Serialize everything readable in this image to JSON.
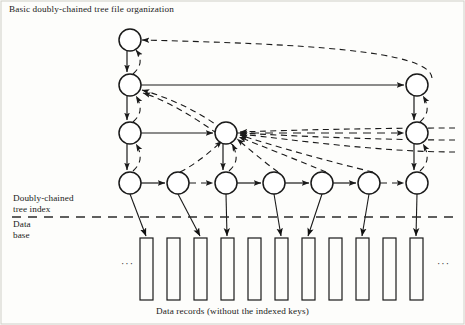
{
  "figure": {
    "title": "Basic doubly-chained tree file organization",
    "caption": "Data records (without the indexed keys)",
    "region_labels": {
      "index": "Doubly-chained\ntree index",
      "database": "Data\nbase"
    },
    "ellipsis_left": "···",
    "ellipsis_right": "···",
    "colors": {
      "stroke": "#1a1a1a",
      "text": "#1a1a1a",
      "background": "#fdfdfb",
      "separator": "#2b2b2b"
    },
    "separator_y": 217,
    "levels": [
      {
        "name": "level-1-root",
        "y": 40,
        "node_x": [
          130
        ]
      },
      {
        "name": "level-2",
        "y": 85,
        "node_x": [
          130,
          417
        ]
      },
      {
        "name": "level-3",
        "y": 133,
        "node_x": [
          130,
          226,
          417
        ]
      },
      {
        "name": "level-4-leaves",
        "y": 183,
        "node_x": [
          130,
          178,
          226,
          274,
          322,
          369,
          417
        ]
      }
    ],
    "node_radius": 11,
    "records": {
      "count": 11,
      "x": [
        140,
        167,
        194,
        221,
        248,
        275,
        302,
        329,
        356,
        383,
        410
      ],
      "top": 238,
      "bottom": 300,
      "width": 13,
      "linked_indices": [
        0,
        2,
        3,
        5,
        6,
        8,
        10
      ]
    },
    "leaf_record_links": [
      {
        "leaf_x": 130,
        "record_x": 146
      },
      {
        "leaf_x": 178,
        "record_x": 200
      },
      {
        "leaf_x": 226,
        "record_x": 227
      },
      {
        "leaf_x": 274,
        "record_x": 281
      },
      {
        "leaf_x": 322,
        "record_x": 308
      },
      {
        "leaf_x": 369,
        "record_x": 362
      },
      {
        "leaf_x": 417,
        "record_x": 416
      }
    ],
    "edge_types": {
      "child": "solid-down",
      "sibling": "solid-right",
      "parent_pointer": "dashed-up"
    }
  }
}
